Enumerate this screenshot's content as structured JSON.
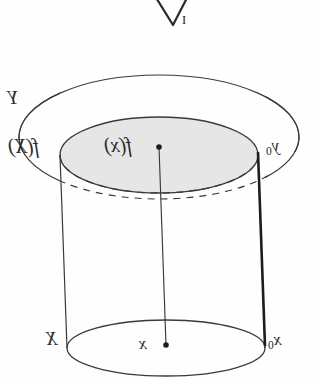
{
  "figure": {
    "orientation_note": "mirrored",
    "background_color": "#fefefe",
    "ink_color": "#2a2a2a",
    "shade_color": "#e6e6e6"
  },
  "labels": {
    "top_clipped": {
      "text": "V",
      "subscript": "I",
      "description": "clipped glyph at top edge of scan"
    },
    "ambient_space": {
      "text": "Y",
      "description": "outer ellipse label"
    },
    "image_set": {
      "text": "f(X)",
      "description": "shaded inner disk label"
    },
    "image_point": {
      "text": "f(x)",
      "description": "point label on top disk"
    },
    "basepoint_image": {
      "base": "y",
      "subscript": "0",
      "text": "y0",
      "description": "distinguished point on top disk boundary"
    },
    "base_space": {
      "text": "X",
      "description": "bottom ellipse label"
    },
    "base_point": {
      "text": "x",
      "description": "point label on bottom ellipse"
    },
    "basepoint": {
      "base": "x",
      "subscript": "0",
      "text": "x0",
      "description": "distinguished point on bottom ellipse boundary"
    }
  },
  "geometry": {
    "outer_ellipse": {
      "cx": 159,
      "cy": 137,
      "rx": 140,
      "ry": 62,
      "label": "Y"
    },
    "top_disk": {
      "cx": 159,
      "cy": 155,
      "rx": 99,
      "ry": 38,
      "label": "f(X)"
    },
    "bottom_ellipse": {
      "cx": 166,
      "cy": 348,
      "rx": 99,
      "ry": 28,
      "label": "X"
    },
    "fiber_center": {
      "x1": 159,
      "y1": 147,
      "x2": 166,
      "y2": 345,
      "label": "f(x) to x"
    },
    "fiber_edge": {
      "x1": 258,
      "y1": 152,
      "x2": 265,
      "y2": 346,
      "label": "y0 to x0",
      "emphasis": "bold"
    },
    "points": [
      {
        "cx": 159,
        "cy": 147,
        "r": 2.6,
        "name": "f(x)"
      },
      {
        "cx": 166,
        "cy": 345,
        "r": 2.6,
        "name": "x"
      }
    ]
  }
}
